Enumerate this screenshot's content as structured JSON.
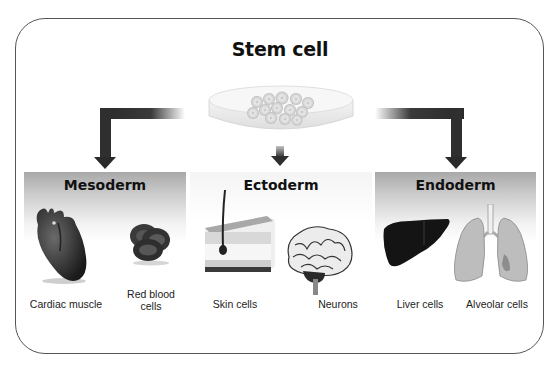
{
  "diagram": {
    "title": "Stem cell",
    "source": {
      "label": "Stem cell",
      "icon": "petri-dish-icon"
    },
    "branches": [
      {
        "name": "Mesoderm",
        "items": [
          {
            "label": "Cardiac muscle",
            "icon": "heart-icon"
          },
          {
            "label_line1": "Red blood",
            "label_line2": "cells",
            "label": "Red blood cells",
            "icon": "red-blood-cell-icon"
          }
        ]
      },
      {
        "name": "Ectoderm",
        "items": [
          {
            "label": "Skin cells",
            "icon": "skin-cross-section-icon"
          },
          {
            "label": "Neurons",
            "icon": "brain-icon"
          }
        ]
      },
      {
        "name": "Endoderm",
        "items": [
          {
            "label": "Liver cells",
            "icon": "liver-icon"
          },
          {
            "label": "Alveolar cells",
            "icon": "lungs-icon"
          }
        ]
      }
    ],
    "colors": {
      "arrow": "#2f2f2f",
      "band_top": "#a9a9a9",
      "band_bottom": "#ffffff",
      "frame_border": "#555555",
      "text": "#111111"
    }
  }
}
